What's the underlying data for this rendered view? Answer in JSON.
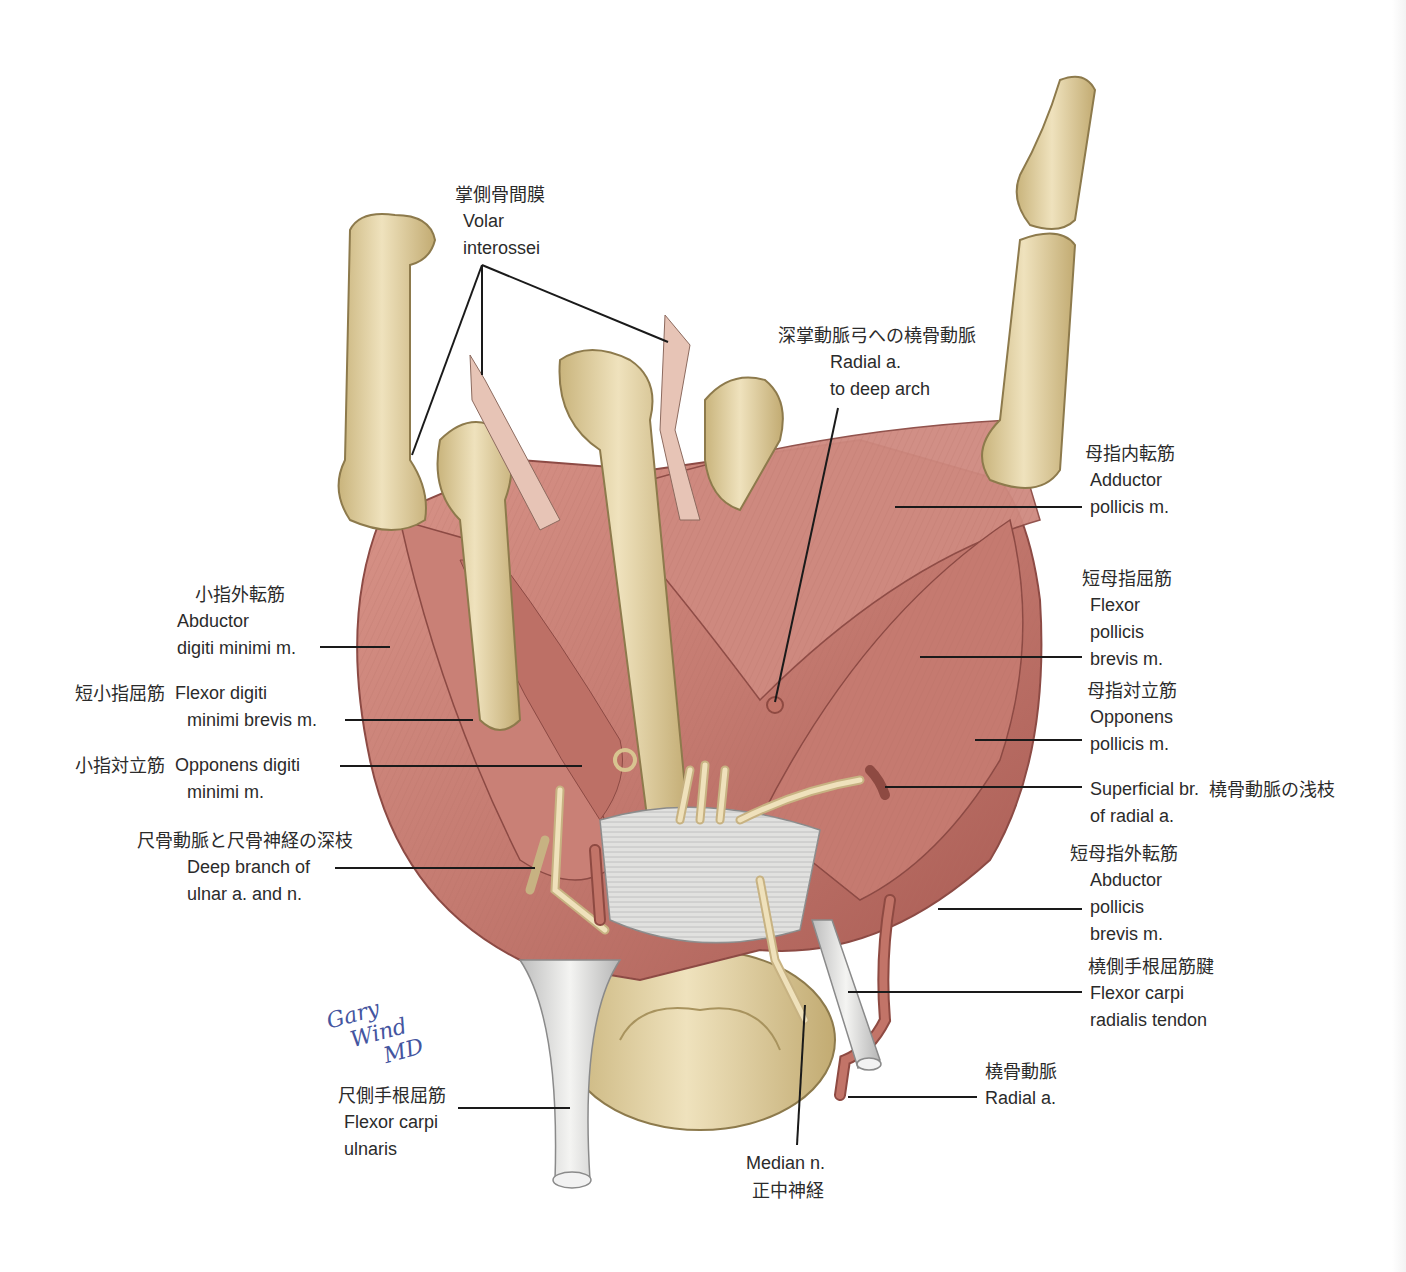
{
  "figure": {
    "colors": {
      "bone": "#e3d2a6",
      "bone_shade": "#c9b47c",
      "muscle": "#c97f74",
      "muscle_dark": "#a85a52",
      "tendon": "#e8e8e6",
      "nerve": "#ecdcb4",
      "artery": "#b86a5e",
      "leader_line": "#1a1a1a",
      "signature": "#4455a0"
    },
    "signature": {
      "line1": "Gary",
      "line2": "Wind",
      "line3": "MD"
    }
  },
  "labels": {
    "volar_interossei": {
      "jp": "掌側骨間膜",
      "en1": "Volar",
      "en2": "interossei"
    },
    "radial_deep_arch": {
      "jp": "深掌動脈弓への橈骨動脈",
      "en1": "Radial a.",
      "en2": "to deep arch"
    },
    "adductor_pollicis": {
      "jp": "母指内転筋",
      "en1": "Adductor",
      "en2": "pollicis m."
    },
    "flexor_pollicis_brevis": {
      "jp": "短母指屈筋",
      "en1": "Flexor",
      "en2": "pollicis",
      "en3": "brevis m."
    },
    "opponens_pollicis": {
      "jp": "母指対立筋",
      "en1": "Opponens",
      "en2": "pollicis m."
    },
    "superficial_br_radial": {
      "jp": "橈骨動脈の浅枝",
      "en1": "Superficial br.",
      "en2": "of radial a."
    },
    "abductor_pollicis_brevis": {
      "jp": "短母指外転筋",
      "en1": "Abductor",
      "en2": "pollicis",
      "en3": "brevis m."
    },
    "flexor_carpi_radialis": {
      "jp": "橈側手根屈筋腱",
      "en1": "Flexor carpi",
      "en2": "radialis tendon"
    },
    "radial_artery": {
      "jp": "橈骨動脈",
      "en1": "Radial a."
    },
    "median_nerve": {
      "en1": "Median n.",
      "jp": "正中神経"
    },
    "flexor_carpi_ulnaris": {
      "jp": "尺側手根屈筋",
      "en1": "Flexor carpi",
      "en2": "ulnaris"
    },
    "deep_branch_ulnar": {
      "jp": "尺骨動脈と尺骨神経の深枝",
      "en1": "Deep branch of",
      "en2": "ulnar a. and n."
    },
    "opponens_digiti_minimi": {
      "jp": "小指対立筋",
      "en1": "Opponens digiti",
      "en2": "minimi m."
    },
    "flexor_digiti_minimi_brevis": {
      "jp": "短小指屈筋",
      "en1": "Flexor digiti",
      "en2": "minimi brevis m."
    },
    "abductor_digiti_minimi": {
      "jp": "小指外転筋",
      "en1": "Abductor",
      "en2": "digiti minimi m."
    }
  }
}
